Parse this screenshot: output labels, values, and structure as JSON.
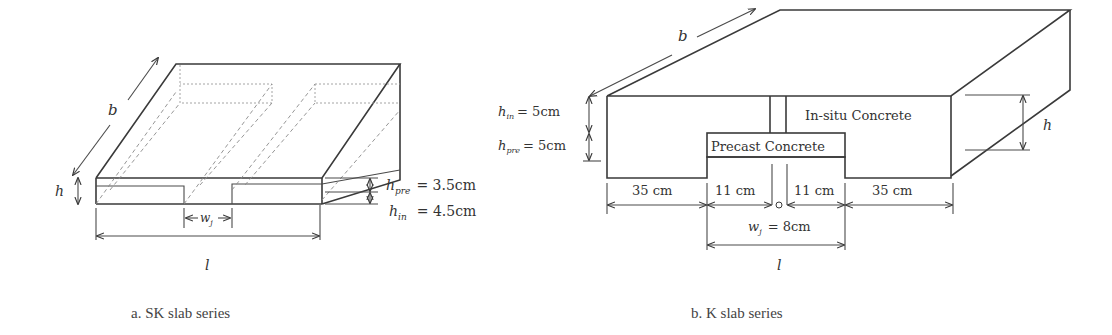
{
  "figure_a": {
    "caption": "a. SK slab series",
    "labels": {
      "b": "b",
      "h": "h",
      "wj": "w",
      "wj_sub": "j",
      "l": "l",
      "h_pre": "h",
      "h_pre_sub": "pre",
      "h_pre_val": "= 3.5cm",
      "h_in": "h",
      "h_in_sub": "in",
      "h_in_val": "= 4.5cm"
    }
  },
  "figure_b": {
    "caption": "b. K slab series",
    "labels": {
      "b": "b",
      "h": "h",
      "l": "l",
      "h_in": "h",
      "h_in_sub": "in",
      "h_in_val": "= 5cm",
      "h_pre": "h",
      "h_pre_sub": "pre",
      "h_pre_val": "= 5cm",
      "in_situ": "In-situ Concrete",
      "precast": "Precast Concrete",
      "dim_left": "35 cm",
      "dim_mid_left": "11 cm",
      "dim_mid_right": "11 cm",
      "dim_right": "35 cm",
      "wj": "w",
      "wj_sub": "j",
      "wj_val": "= 8cm"
    }
  }
}
